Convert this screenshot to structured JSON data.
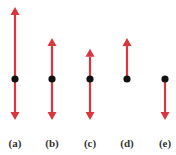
{
  "figure": {
    "arrow_color": "#d9363e",
    "dot_color": "#111111",
    "panels": [
      {
        "label": "(a)",
        "up": 1.0,
        "down": 0.57
      },
      {
        "label": "(b)",
        "up": 0.57,
        "down": 0.57
      },
      {
        "label": "(c)",
        "up": 0.42,
        "down": 0.57
      },
      {
        "label": "(d)",
        "up": 0.57,
        "down": 0
      },
      {
        "label": "(e)",
        "up": 0,
        "down": 0.57
      }
    ]
  }
}
